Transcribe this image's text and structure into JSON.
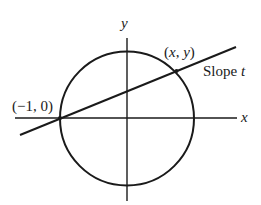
{
  "diagram": {
    "type": "unit-circle-rational-parametrization",
    "axes": {
      "x_label": "x",
      "y_label": "y"
    },
    "circle": {
      "center": [
        127,
        118
      ],
      "radius": 67
    },
    "line": {
      "from": [
        20,
        135
      ],
      "to": [
        236,
        47
      ],
      "label_prefix": "Slope ",
      "label_var": "t"
    },
    "points": [
      {
        "name": "left-intersection",
        "label": "(−1, 0)",
        "pos": [
          60,
          118
        ]
      },
      {
        "name": "right-intersection",
        "label_open": "(",
        "label_x": "x",
        "label_sep": ", ",
        "label_y": "y",
        "label_close": ")",
        "pos": [
          176,
          71
        ]
      }
    ],
    "colors": {
      "stroke": "#1a1a1a",
      "background": "#ffffff"
    }
  }
}
